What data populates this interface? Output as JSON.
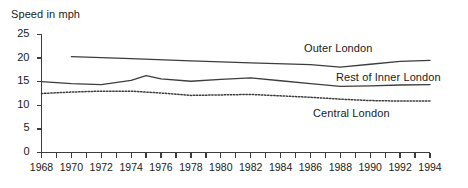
{
  "chart_data": {
    "type": "line",
    "title": "",
    "ylabel": "Speed in mph",
    "xlabel": "",
    "ylim": [
      0,
      25
    ],
    "xlim": [
      1968,
      1994
    ],
    "yticks": [
      0,
      5,
      10,
      15,
      20,
      25
    ],
    "xticks": [
      1968,
      1969,
      1970,
      1971,
      1972,
      1973,
      1974,
      1975,
      1976,
      1977,
      1978,
      1979,
      1980,
      1981,
      1982,
      1983,
      1984,
      1985,
      1986,
      1987,
      1988,
      1989,
      1990,
      1991,
      1992,
      1993,
      1994
    ],
    "xtick_labels": [
      "1968",
      "",
      "1970",
      "",
      "1972",
      "",
      "1974",
      "",
      "1976",
      "",
      "1978",
      "",
      "1980",
      "",
      "1982",
      "",
      "1984",
      "",
      "1986",
      "",
      "1988",
      "",
      "1990",
      "",
      "1992",
      "",
      "1994"
    ],
    "grid": false,
    "legend_position": "inline-right",
    "series": [
      {
        "name": "Outer London",
        "style": "solid",
        "color": "#3d3d3d",
        "x": [
          1970,
          1974,
          1978,
          1982,
          1986,
          1988,
          1990,
          1992,
          1994
        ],
        "values": [
          20.3,
          19.9,
          19.4,
          19.0,
          18.6,
          18.1,
          18.7,
          19.3,
          19.5
        ]
      },
      {
        "name": "Rest of Inner London",
        "style": "solid",
        "color": "#3d3d3d",
        "x": [
          1968,
          1970,
          1972,
          1974,
          1975,
          1976,
          1978,
          1980,
          1982,
          1984,
          1986,
          1988,
          1990,
          1992,
          1994
        ],
        "values": [
          15.0,
          14.6,
          14.4,
          15.3,
          16.3,
          15.6,
          15.1,
          15.5,
          15.8,
          15.2,
          14.6,
          14.0,
          14.1,
          14.3,
          14.4
        ]
      },
      {
        "name": "Central London",
        "style": "dotted",
        "color": "#3d3d3d",
        "x": [
          1968,
          1970,
          1972,
          1974,
          1976,
          1978,
          1980,
          1982,
          1984,
          1986,
          1988,
          1990,
          1992,
          1994
        ],
        "values": [
          12.5,
          12.8,
          13.0,
          13.0,
          12.6,
          12.1,
          12.2,
          12.3,
          12.0,
          11.7,
          11.3,
          11.0,
          10.9,
          10.9
        ]
      }
    ],
    "axis_color": "#3d3d3d"
  }
}
